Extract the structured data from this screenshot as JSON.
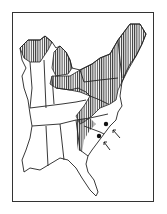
{
  "map": {
    "title": "",
    "region": "Eastern United States",
    "colors": {
      "outline": "#222222",
      "hatch": "#333333",
      "background": "#ffffff"
    },
    "hatched_range": "northern and Appalachian states",
    "markers": [
      {
        "type": "dot",
        "x": 106,
        "y": 124
      },
      {
        "type": "dot",
        "x": 99,
        "y": 136
      }
    ],
    "arrows": [
      {
        "from": [
          120,
          138
        ],
        "to": [
          113,
          130
        ]
      },
      {
        "from": [
          110,
          150
        ],
        "to": [
          104,
          142
        ]
      }
    ]
  }
}
